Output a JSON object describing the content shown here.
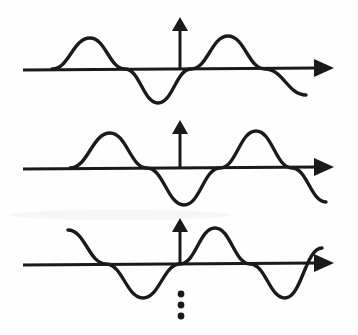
{
  "figure": {
    "background_color": "#fefefe",
    "ink_color": "#1a1a1a",
    "width": 358,
    "height": 335,
    "continuation_marker": "vertical-ellipsis"
  },
  "chart_data": {
    "type": "line",
    "subtitle": "",
    "xlabel": "",
    "ylabel": "",
    "grid": false,
    "legend": null,
    "axis_style": "hand-drawn arrow axes, no tick labels",
    "xlim": [
      0,
      358
    ],
    "ylim_note": "amplitude in pixels about each wave baseline",
    "panels": [
      {
        "name": "wave-1",
        "baseline_y": 69,
        "amplitude": 32,
        "wavelength": 138,
        "phase_deg": 0,
        "x_start": 52,
        "x_end": 306,
        "axis": {
          "x_start": 23,
          "x_end": 332,
          "y": 69,
          "arrow": "right"
        },
        "vertical_arrow": {
          "x": 180,
          "y_top": 17,
          "y_bottom": 69
        },
        "features": [
          {
            "type": "zero-crossing-rising",
            "x": 52
          },
          {
            "type": "crest",
            "x": 90,
            "y": 38
          },
          {
            "type": "zero-crossing-falling",
            "x": 125
          },
          {
            "type": "trough",
            "x": 158,
            "y": 103
          },
          {
            "type": "zero-crossing-rising",
            "x": 191
          },
          {
            "type": "crest",
            "x": 228,
            "y": 36
          },
          {
            "type": "zero-crossing-falling",
            "x": 265
          },
          {
            "type": "end",
            "x": 306,
            "y": 95
          }
        ]
      },
      {
        "name": "wave-2",
        "baseline_y": 168,
        "amplitude": 35,
        "wavelength": 150,
        "phase_deg": 30,
        "x_start": 70,
        "x_end": 326,
        "axis": {
          "x_start": 23,
          "x_end": 332,
          "y": 168,
          "arrow": "right"
        },
        "vertical_arrow": {
          "x": 180,
          "y_top": 120,
          "y_bottom": 168
        },
        "features": [
          {
            "type": "zero-crossing-rising",
            "x": 70
          },
          {
            "type": "crest",
            "x": 110,
            "y": 133
          },
          {
            "type": "zero-crossing-falling",
            "x": 147
          },
          {
            "type": "trough",
            "x": 184,
            "y": 205
          },
          {
            "type": "zero-crossing-rising",
            "x": 220
          },
          {
            "type": "crest",
            "x": 256,
            "y": 131
          },
          {
            "type": "zero-crossing-falling",
            "x": 292
          },
          {
            "type": "end",
            "x": 326,
            "y": 202
          }
        ]
      },
      {
        "name": "wave-3",
        "baseline_y": 264,
        "amplitude": 36,
        "wavelength": 144,
        "phase_deg": 100,
        "x_start": 68,
        "x_end": 322,
        "axis": {
          "x_start": 23,
          "x_end": 332,
          "y": 264,
          "arrow": "right"
        },
        "vertical_arrow": {
          "x": 180,
          "y_top": 218,
          "y_bottom": 264
        },
        "features": [
          {
            "type": "crest-start",
            "x": 68,
            "y": 230
          },
          {
            "type": "zero-crossing-falling",
            "x": 106
          },
          {
            "type": "trough",
            "x": 143,
            "y": 298
          },
          {
            "type": "zero-crossing-rising",
            "x": 180
          },
          {
            "type": "crest",
            "x": 215,
            "y": 228
          },
          {
            "type": "zero-crossing-falling",
            "x": 250
          },
          {
            "type": "trough",
            "x": 285,
            "y": 298
          },
          {
            "type": "end-rising",
            "x": 322,
            "y": 248
          }
        ]
      }
    ],
    "annotations": [
      {
        "name": "continuation-ellipsis",
        "text": "⋮",
        "x": 181,
        "dots_y": [
          294,
          305,
          316
        ],
        "meaning": "series continues"
      }
    ]
  },
  "elements": {
    "wave_1_label": "wave-1",
    "wave_2_label": "wave-2",
    "wave_3_label": "wave-3"
  }
}
